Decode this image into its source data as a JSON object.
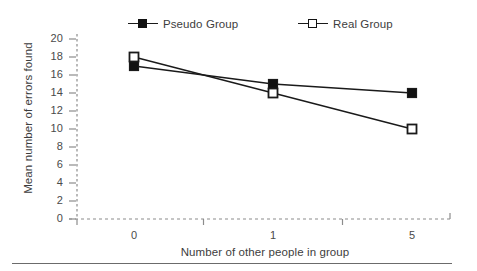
{
  "chart_data": {
    "type": "line",
    "title": "",
    "subtitle": "",
    "xlabel": "Number of other people in group",
    "ylabel": "Mean number of errors found",
    "categories": [
      "0",
      "1",
      "5"
    ],
    "x": [
      0,
      1,
      5
    ],
    "series": [
      {
        "name": "Pseudo Group",
        "marker": "filled-square",
        "values": [
          17,
          15,
          14
        ]
      },
      {
        "name": "Real Group",
        "marker": "open-square",
        "values": [
          18,
          14,
          10
        ]
      }
    ],
    "ylim": [
      0,
      20
    ],
    "ytick_step": 2,
    "yticks": [
      0,
      2,
      4,
      6,
      8,
      10,
      12,
      14,
      16,
      18,
      20
    ],
    "xticks": [
      "0",
      "1",
      "5"
    ],
    "grid": false,
    "axis_style": "dashed",
    "legend_position": "top",
    "legend": [
      "Pseudo Group",
      "Real Group"
    ],
    "annotations": []
  },
  "colors": {
    "line": "#1a1a1a",
    "marker_fill": "#111111",
    "marker_open_fill": "#ffffff",
    "axis": "#8c8c8c",
    "text": "#3d3d3d",
    "rule": "#6b6b6b",
    "background": "#ffffff"
  },
  "legend_items": [
    {
      "label": "Pseudo Group",
      "marker": "filled-square"
    },
    {
      "label": "Real Group",
      "marker": "open-square"
    }
  ]
}
